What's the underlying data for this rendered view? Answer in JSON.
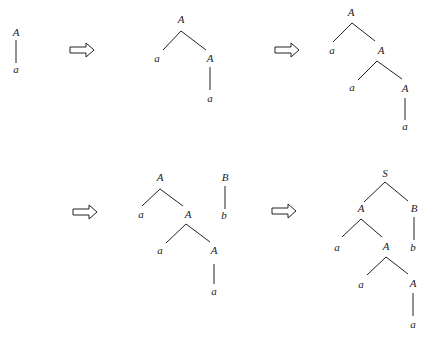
{
  "colors": {
    "stroke": "#222222",
    "background": "#ffffff"
  },
  "arrows": [
    {
      "name": "arrow-1",
      "x": 70,
      "y": 50
    },
    {
      "name": "arrow-2",
      "x": 275,
      "y": 50
    },
    {
      "name": "arrow-3",
      "x": 73,
      "y": 212
    },
    {
      "name": "arrow-4",
      "x": 272,
      "y": 211
    }
  ],
  "trees": [
    {
      "name": "tree-1",
      "nodes": [
        {
          "id": "n1",
          "label": "A",
          "x": 16,
          "y": 33
        },
        {
          "id": "n2",
          "label": "a",
          "x": 16,
          "y": 70
        }
      ],
      "edges": [
        {
          "x1": 16,
          "y1": 40,
          "x2": 16,
          "y2": 63
        }
      ]
    },
    {
      "name": "tree-2",
      "nodes": [
        {
          "id": "n1",
          "label": "A",
          "x": 181,
          "y": 20
        },
        {
          "id": "n2",
          "label": "a",
          "x": 157,
          "y": 59
        },
        {
          "id": "n3",
          "label": "A",
          "x": 210,
          "y": 59
        },
        {
          "id": "n4",
          "label": "a",
          "x": 210,
          "y": 99
        }
      ],
      "edges": [
        {
          "x1": 181,
          "y1": 31,
          "x2": 163,
          "y2": 50
        },
        {
          "x1": 181,
          "y1": 31,
          "x2": 206,
          "y2": 50
        },
        {
          "x1": 210,
          "y1": 67,
          "x2": 210,
          "y2": 90
        }
      ]
    },
    {
      "name": "tree-3",
      "nodes": [
        {
          "id": "n1",
          "label": "A",
          "x": 351,
          "y": 13
        },
        {
          "id": "n2",
          "label": "a",
          "x": 332,
          "y": 51
        },
        {
          "id": "n3",
          "label": "A",
          "x": 381,
          "y": 51
        },
        {
          "id": "n4",
          "label": "a",
          "x": 352,
          "y": 88
        },
        {
          "id": "n5",
          "label": "A",
          "x": 405,
          "y": 89
        },
        {
          "id": "n6",
          "label": "a",
          "x": 405,
          "y": 127
        }
      ],
      "edges": [
        {
          "x1": 352,
          "y1": 23,
          "x2": 333,
          "y2": 42
        },
        {
          "x1": 352,
          "y1": 23,
          "x2": 375,
          "y2": 41
        },
        {
          "x1": 377,
          "y1": 61,
          "x2": 358,
          "y2": 80
        },
        {
          "x1": 377,
          "y1": 61,
          "x2": 402,
          "y2": 79
        },
        {
          "x1": 405,
          "y1": 98,
          "x2": 405,
          "y2": 120
        }
      ]
    },
    {
      "name": "tree-4",
      "nodes": [
        {
          "id": "n1",
          "label": "A",
          "x": 160,
          "y": 178
        },
        {
          "id": "n2",
          "label": "a",
          "x": 141,
          "y": 215
        },
        {
          "id": "n3",
          "label": "A",
          "x": 188,
          "y": 215
        },
        {
          "id": "n4",
          "label": "a",
          "x": 160,
          "y": 251
        },
        {
          "id": "n5",
          "label": "A",
          "x": 214,
          "y": 251
        },
        {
          "id": "n6",
          "label": "a",
          "x": 214,
          "y": 292
        },
        {
          "id": "n7",
          "label": "B",
          "x": 225,
          "y": 178
        },
        {
          "id": "n8",
          "label": "b",
          "x": 224,
          "y": 216
        }
      ],
      "edges": [
        {
          "x1": 160,
          "y1": 189,
          "x2": 142,
          "y2": 206
        },
        {
          "x1": 160,
          "y1": 189,
          "x2": 183,
          "y2": 206
        },
        {
          "x1": 186,
          "y1": 224,
          "x2": 166,
          "y2": 243
        },
        {
          "x1": 186,
          "y1": 224,
          "x2": 210,
          "y2": 242
        },
        {
          "x1": 214,
          "y1": 264,
          "x2": 214,
          "y2": 284
        },
        {
          "x1": 225,
          "y1": 186,
          "x2": 225,
          "y2": 209
        }
      ]
    },
    {
      "name": "tree-5",
      "nodes": [
        {
          "id": "n1",
          "label": "S",
          "x": 385,
          "y": 174
        },
        {
          "id": "n2",
          "label": "A",
          "x": 361,
          "y": 209
        },
        {
          "id": "n3",
          "label": "B",
          "x": 414,
          "y": 209
        },
        {
          "id": "n4",
          "label": "a",
          "x": 337,
          "y": 248
        },
        {
          "id": "n5",
          "label": "A",
          "x": 386,
          "y": 247
        },
        {
          "id": "n6",
          "label": "b",
          "x": 413,
          "y": 248
        },
        {
          "id": "n7",
          "label": "a",
          "x": 361,
          "y": 285
        },
        {
          "id": "n8",
          "label": "A",
          "x": 413,
          "y": 284
        },
        {
          "id": "n9",
          "label": "a",
          "x": 413,
          "y": 325
        }
      ],
      "edges": [
        {
          "x1": 385,
          "y1": 182,
          "x2": 364,
          "y2": 202
        },
        {
          "x1": 385,
          "y1": 182,
          "x2": 408,
          "y2": 201
        },
        {
          "x1": 361,
          "y1": 219,
          "x2": 342,
          "y2": 237
        },
        {
          "x1": 361,
          "y1": 219,
          "x2": 382,
          "y2": 237
        },
        {
          "x1": 414,
          "y1": 217,
          "x2": 414,
          "y2": 240
        },
        {
          "x1": 386,
          "y1": 257,
          "x2": 367,
          "y2": 275
        },
        {
          "x1": 386,
          "y1": 257,
          "x2": 408,
          "y2": 274
        },
        {
          "x1": 413,
          "y1": 293,
          "x2": 413,
          "y2": 316
        }
      ]
    }
  ]
}
